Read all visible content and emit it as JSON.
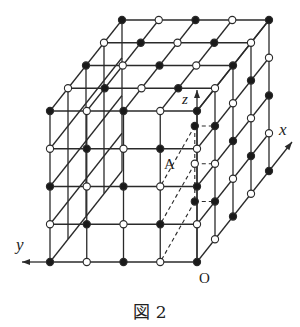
{
  "figure": {
    "caption": "図 2",
    "labels": {
      "x_axis": "x",
      "y_axis": "y",
      "z_axis": "z",
      "origin": "O",
      "point_a": "A"
    },
    "colors": {
      "line": "#2a2a2a",
      "filled_node": "#1a1a1a",
      "empty_node_fill": "#ffffff"
    },
    "lattice": {
      "size": 4,
      "description": "5x5x5 lattice of points on cube surface; node filled when (x+y+z) is even",
      "front_face_rows_top_to_bottom": [
        [
          "filled",
          "empty",
          "filled",
          "empty",
          "filled"
        ],
        [
          "empty",
          "filled",
          "empty",
          "filled",
          "empty"
        ],
        [
          "filled",
          "empty",
          "filled",
          "empty",
          "filled"
        ],
        [
          "empty",
          "filled",
          "empty",
          "filled",
          "empty"
        ],
        [
          "filled",
          "empty",
          "filled",
          "empty",
          "filled"
        ]
      ]
    },
    "hidden_points": [
      {
        "name": "A",
        "coords": [
          1,
          0,
          3
        ],
        "state": "filled"
      },
      {
        "coords": [
          1,
          0,
          2
        ],
        "state": "empty"
      },
      {
        "coords": [
          1,
          0,
          1
        ],
        "state": "filled"
      }
    ]
  }
}
